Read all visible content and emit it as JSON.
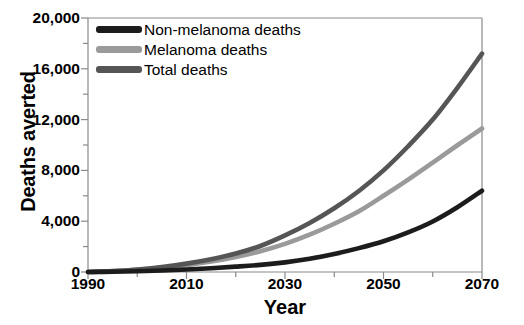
{
  "chart_data": {
    "type": "line",
    "title": "",
    "xlabel": "Year",
    "ylabel": "Deaths averted",
    "xlim": [
      1990,
      2070
    ],
    "ylim": [
      0,
      20000
    ],
    "grid": false,
    "legend_position": "top-left",
    "x_ticks": [
      1990,
      2000,
      2010,
      2020,
      2030,
      2040,
      2050,
      2060,
      2070
    ],
    "x_tick_labels": [
      "1990",
      "",
      "2010",
      "",
      "2030",
      "",
      "2050",
      "",
      "2070"
    ],
    "y_ticks": [
      0,
      2000,
      4000,
      6000,
      8000,
      10000,
      12000,
      14000,
      16000,
      18000,
      20000
    ],
    "y_tick_labels": [
      "0",
      "",
      "4,000",
      "",
      "8,000",
      "",
      "12,000",
      "",
      "16,000",
      "",
      "20,000"
    ],
    "x": [
      1990,
      1995,
      2000,
      2005,
      2010,
      2015,
      2020,
      2025,
      2030,
      2035,
      2040,
      2045,
      2050,
      2055,
      2060,
      2065,
      2070
    ],
    "series": [
      {
        "name": "Non-melanoma deaths",
        "color": "#1c1c1c",
        "values": [
          0,
          20,
          60,
          120,
          200,
          300,
          420,
          560,
          760,
          1040,
          1420,
          1880,
          2420,
          3120,
          3980,
          5100,
          6400
        ]
      },
      {
        "name": "Melanoma deaths",
        "color": "#9a9a9a",
        "values": [
          0,
          60,
          170,
          330,
          540,
          820,
          1180,
          1640,
          2220,
          2940,
          3800,
          4780,
          6000,
          7280,
          8620,
          9980,
          11300
        ]
      },
      {
        "name": "Total deaths",
        "color": "#555555",
        "values": [
          0,
          70,
          200,
          400,
          660,
          1000,
          1450,
          2050,
          2880,
          3860,
          5020,
          6380,
          8000,
          9900,
          12000,
          14500,
          17200
        ]
      }
    ]
  },
  "legend": {
    "items": [
      {
        "label": "Non-melanoma deaths",
        "color": "#1c1c1c"
      },
      {
        "label": "Melanoma deaths",
        "color": "#9a9a9a"
      },
      {
        "label": "Total deaths",
        "color": "#555555"
      }
    ]
  },
  "axes": {
    "frame_color": "#8a8a8a",
    "tick_color": "#8a8a8a"
  }
}
